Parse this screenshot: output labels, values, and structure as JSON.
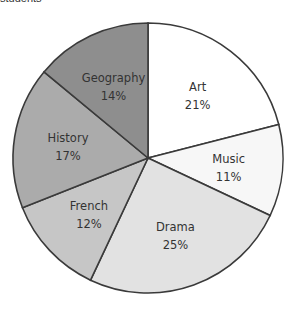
{
  "title_partial": "students",
  "chart_data": {
    "type": "pie",
    "title": "students",
    "start_angle_deg": 0,
    "direction": "clockwise",
    "slices": [
      {
        "label": "Art",
        "value": 21,
        "display": "21%",
        "color": "#ffffff"
      },
      {
        "label": "Music",
        "value": 11,
        "display": "11%",
        "color": "#f7f7f7"
      },
      {
        "label": "Drama",
        "value": 25,
        "display": "25%",
        "color": "#e2e2e2"
      },
      {
        "label": "French",
        "value": 12,
        "display": "12%",
        "color": "#c6c6c6"
      },
      {
        "label": "History",
        "value": 17,
        "display": "17%",
        "color": "#ababab"
      },
      {
        "label": "Geography",
        "value": 14,
        "display": "14%",
        "color": "#8e8e8e"
      }
    ],
    "center": [
      148,
      158
    ],
    "radius": 135
  }
}
